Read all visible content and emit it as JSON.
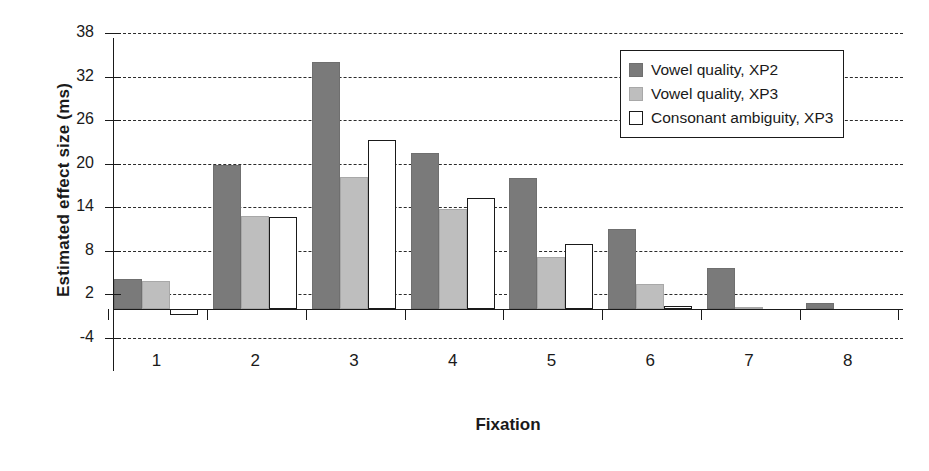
{
  "chart_data": {
    "type": "bar",
    "title": "",
    "xlabel": "Fixation",
    "ylabel": "Estimated effect size (ms)",
    "categories": [
      "1",
      "2",
      "3",
      "4",
      "5",
      "6",
      "7",
      "8"
    ],
    "ylim": [
      -4,
      38
    ],
    "yticks": [
      -4,
      2,
      8,
      14,
      20,
      26,
      32,
      38
    ],
    "ytick_labels": [
      "-4",
      "2",
      "8",
      "14",
      "20",
      "26",
      "32",
      "38"
    ],
    "grid": true,
    "grid_style": "dashed horizontal",
    "legend_position": "upper right",
    "series": [
      {
        "name": "Vowel quality, XP2",
        "color": "#7a7a7a",
        "values": [
          4.1,
          19.8,
          34.0,
          21.5,
          18.0,
          11.0,
          5.6,
          0.8
        ]
      },
      {
        "name": "Vowel quality, XP3",
        "color": "#bebebe",
        "values": [
          3.9,
          12.8,
          18.2,
          13.7,
          7.1,
          3.4,
          0.3,
          0.0
        ]
      },
      {
        "name": "Consonant ambiguity, XP3",
        "color": "#ffffff",
        "values": [
          -0.8,
          12.6,
          23.2,
          15.3,
          8.9,
          0.4,
          0.0,
          0.0
        ]
      }
    ]
  },
  "legend": {
    "items": [
      {
        "label": "Vowel quality, XP2",
        "swatch": "dark-gray-swatch"
      },
      {
        "label": "Vowel quality, XP3",
        "swatch": "light-gray-swatch"
      },
      {
        "label": "Consonant ambiguity, XP3",
        "swatch": "white-outline-swatch"
      }
    ]
  },
  "axes": {
    "y_title": "Estimated effect size (ms)",
    "x_title": "Fixation"
  }
}
